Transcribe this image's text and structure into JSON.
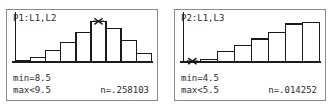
{
  "panels": [
    {
      "id": "plot1",
      "title": "P1:L1,L2",
      "readout": {
        "min_label": "min=8.5",
        "max_label": "max<9.5",
        "n_label": "n=.258103"
      },
      "cursor": {
        "bar_index": 5,
        "marker": "crosshair-marker"
      },
      "chart_data": {
        "type": "bar",
        "title": "P1:L1,L2",
        "xlabel": "",
        "ylabel": "",
        "categories": [
          "1",
          "2",
          "3",
          "4",
          "5",
          "6",
          "7",
          "8",
          "9"
        ],
        "values": [
          2,
          5,
          13,
          22,
          33,
          46,
          38,
          24,
          10
        ],
        "ylim": [
          0,
          52
        ],
        "grid": false,
        "legend": "none",
        "bin_min": 8.5,
        "bin_max": 9.5,
        "selected_value": 0.258103
      }
    },
    {
      "id": "plot2",
      "title": "P2:L1,L3",
      "readout": {
        "min_label": "min=4.5",
        "max_label": "max<5.5",
        "n_label": "n=.014252"
      },
      "cursor": {
        "bar_index": 0,
        "marker": "crosshair-marker"
      },
      "chart_data": {
        "type": "bar",
        "title": "P2:L1,L3",
        "xlabel": "",
        "ylabel": "",
        "categories": [
          "1",
          "2",
          "3",
          "4",
          "5",
          "6",
          "7",
          "8"
        ],
        "values": [
          1,
          3,
          12,
          19,
          26,
          33,
          43,
          45
        ],
        "ylim": [
          0,
          52
        ],
        "grid": false,
        "legend": "none",
        "bin_min": 4.5,
        "bin_max": 5.5,
        "selected_value": 0.014252
      }
    }
  ],
  "style": {
    "stroke": "#1a1a1a",
    "fill": "#ffffff",
    "axis": "#1a1a1a",
    "border": "#8a8a8a",
    "text": "#2b2b2b"
  }
}
